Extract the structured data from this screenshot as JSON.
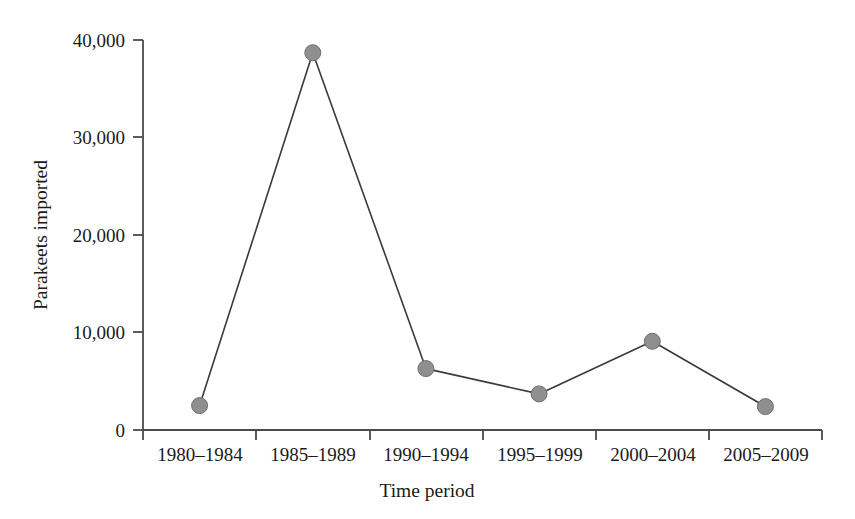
{
  "chart_data": {
    "type": "line",
    "title": "",
    "subtitle": "",
    "xlabel": "Time period",
    "ylabel": "Parakeets imported",
    "categories": [
      "1980–1984",
      "1985–1989",
      "1990–1994",
      "1995–1999",
      "2000–2004",
      "2005–2009"
    ],
    "values": [
      2500,
      38700,
      6300,
      3700,
      9100,
      2400
    ],
    "ylim": [
      0,
      40000
    ],
    "yticks": [
      0,
      10000,
      20000,
      30000,
      40000
    ],
    "ytick_labels": [
      "0",
      "10,000",
      "20,000",
      "30,000",
      "40,000"
    ],
    "grid": false,
    "legend": false,
    "legend_position": "none",
    "marker": "circle",
    "marker_color": "#8f8f8f",
    "marker_edge_color": "#6e6e6e",
    "line_color": "#3a3a3a",
    "axis_color": "#4a4a4a",
    "background_color": "#ffffff"
  },
  "axes": {
    "x_axis_label": "Time period",
    "y_axis_label": "Parakeets imported"
  },
  "ticks": {
    "y": [
      "40,000",
      "30,000",
      "20,000",
      "10,000",
      "0"
    ],
    "x": [
      "1980–1984",
      "1985–1989",
      "1990–1994",
      "1995–1999",
      "2000–2004",
      "2005–2009"
    ]
  },
  "points": [
    {
      "category": "1980–1984",
      "value": 2500
    },
    {
      "category": "1985–1989",
      "value": 38700
    },
    {
      "category": "1990–1994",
      "value": 6300
    },
    {
      "category": "1995–1999",
      "value": 3700
    },
    {
      "category": "2000–2004",
      "value": 9100
    },
    {
      "category": "2005–2009",
      "value": 2400
    }
  ]
}
